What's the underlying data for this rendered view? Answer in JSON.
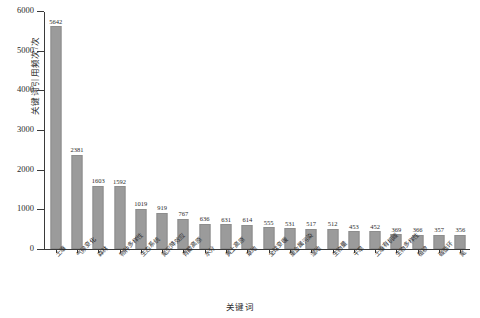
{
  "chart_data": {
    "type": "bar",
    "title": "",
    "xlabel": "关键词",
    "ylabel": "关键词引用频次/次",
    "ylim": [
      0,
      6000
    ],
    "ytick_values": [
      0,
      1000,
      2000,
      3000,
      4000,
      5000,
      6000
    ],
    "ytick_labels": [
      "0",
      "1000",
      "2000",
      "3000",
      "4000",
      "5000",
      "6000"
    ],
    "grid": false,
    "legend": "none",
    "bar_color": "#9b9b9b",
    "axis_color": "#3a3a3a",
    "categories": [
      "土壤",
      "气候变化",
      "森林",
      "物种多样性",
      "生态系统",
      "氮沉降效应",
      "青藏高原",
      "水分",
      "黄土高原",
      "草地",
      "全球变暖",
      "重金属污染",
      "湿地",
      "生物量",
      "干旱",
      "土壤有机碳",
      "生物多样性",
      "植被",
      "碳循环",
      "氮"
    ],
    "values": [
      5642,
      2381,
      1603,
      1592,
      1019,
      919,
      767,
      636,
      631,
      614,
      555,
      531,
      517,
      512,
      453,
      452,
      369,
      366,
      357,
      356
    ],
    "value_labels": [
      "5642",
      "2381",
      "1603",
      "1592",
      "1019",
      "919",
      "767",
      "636",
      "631",
      "614",
      "555",
      "531",
      "517",
      "512",
      "453",
      "452",
      "369",
      "366",
      "357",
      "356"
    ]
  }
}
